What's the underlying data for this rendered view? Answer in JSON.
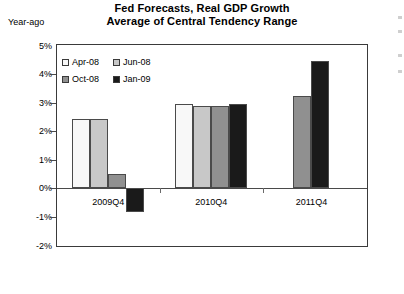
{
  "chart_data": {
    "type": "bar",
    "title": "Fed Forecasts, Real GDP Growth",
    "subtitle": "Average of Central Tendency Range",
    "unit_label": "Year-ago",
    "xlabel": "",
    "ylabel": "",
    "ylim": [
      -2,
      5
    ],
    "ytick_labels": [
      "5%",
      "4%",
      "3%",
      "2%",
      "1%",
      "0%",
      "-1%",
      "-2%"
    ],
    "ytick_values": [
      5,
      4,
      3,
      2,
      1,
      0,
      -1,
      -2
    ],
    "grid": false,
    "legend_position": "top-left",
    "categories": [
      "2009Q4",
      "2010Q4",
      "2011Q4"
    ],
    "series": [
      {
        "name": "Apr-08",
        "color": "#f8f8f8",
        "values": [
          2.4,
          2.95,
          null
        ]
      },
      {
        "name": "Jun-08",
        "color": "#c8c8c8",
        "values": [
          2.4,
          2.85,
          null
        ]
      },
      {
        "name": "Oct-08",
        "color": "#909090",
        "values": [
          0.5,
          2.85,
          3.2
        ]
      },
      {
        "name": "Jan-09",
        "color": "#1a1a1a",
        "values": [
          -0.85,
          2.95,
          4.45
        ]
      }
    ]
  },
  "colors": {
    "axis": "#3a3a3a",
    "bar_outline": "#4a4a4a",
    "background": "#ffffff",
    "text": "#000000"
  }
}
